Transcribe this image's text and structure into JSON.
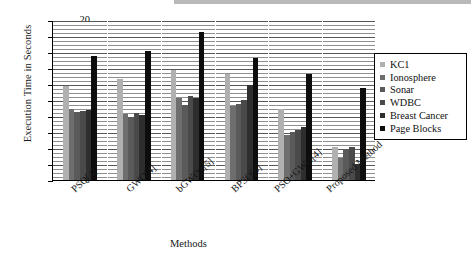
{
  "chart_data": {
    "type": "bar",
    "title": "",
    "xlabel": "Methods",
    "ylabel": "Execution Time in Seconds",
    "ylim": [
      0,
      20
    ],
    "ytick_step": 2,
    "yticks": [
      0,
      2,
      4,
      6,
      8,
      10,
      12,
      14,
      16,
      18,
      20
    ],
    "grid": true,
    "legend_position": "right",
    "categories": [
      "PSO[4]",
      "GWO[4]",
      "bGWO2[5]",
      "BPSO[8]",
      "PSO+GWO[4]",
      "Proposed Method"
    ],
    "series": [
      {
        "name": "KC1",
        "color": "#b0b0b0",
        "values": [
          11.7,
          12.6,
          13.75,
          13.2,
          8.9,
          4.1
        ]
      },
      {
        "name": "Ionosphere",
        "color": "#6e6e6e",
        "values": [
          8.85,
          8.2,
          10.2,
          9.3,
          5.65,
          2.8
        ]
      },
      {
        "name": "Sonar",
        "color": "#5a5a5a",
        "values": [
          8.55,
          7.8,
          9.4,
          9.45,
          6.0,
          3.85
        ]
      },
      {
        "name": "WDBC",
        "color": "#4a4a4a",
        "values": [
          8.6,
          8.4,
          10.5,
          10.05,
          6.2,
          4.1
        ]
      },
      {
        "name": "Breast Cancer",
        "color": "#2e2e2e",
        "values": [
          8.7,
          8.15,
          10.3,
          11.85,
          6.6,
          1.95
        ]
      },
      {
        "name": "Page Blocks",
        "color": "#0d0d0d",
        "values": [
          15.5,
          16.15,
          18.5,
          15.25,
          13.3,
          11.5
        ]
      }
    ]
  },
  "axes": {
    "y_title": "Execution Time in Seconds",
    "x_title": "Methods"
  }
}
